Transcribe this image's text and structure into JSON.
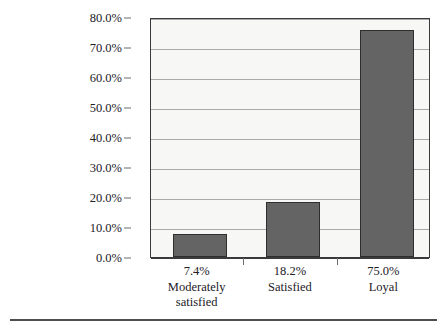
{
  "chart_data": {
    "type": "bar",
    "title": "",
    "subtitle": "",
    "xlabel": "",
    "ylabel": "",
    "categories": [
      "Moderately satisfied",
      "Satisfied",
      "Loyal"
    ],
    "category_lines": [
      [
        "7.4%",
        "Moderately",
        "satisfied"
      ],
      [
        "18.2%",
        "Satisfied"
      ],
      [
        "75.0%",
        "Loyal"
      ]
    ],
    "value_labels": [
      "7.4%",
      "18.2%",
      "75.0%"
    ],
    "values": [
      7.4,
      18.2,
      75.0
    ],
    "bar_plotted_values": [
      7.8,
      18.5,
      75.8
    ],
    "ylim": [
      0,
      80
    ],
    "ytick_step": 10,
    "ytick_labels": [
      "80.0%",
      "70.0%",
      "60.0%",
      "50.0%",
      "40.0%",
      "30.0%",
      "20.0%",
      "10.0%",
      "0.0%"
    ],
    "ytick_values": [
      80,
      70,
      60,
      50,
      40,
      30,
      20,
      10,
      0
    ],
    "grid": true,
    "legend": false,
    "legend_position": "none",
    "colors": {
      "bar_fill": "#646464",
      "bar_border": "#2e2e2e",
      "plot_background": "#f7f7f5",
      "plot_frame": "#3a3a3a",
      "gridline": "#a9a9a9",
      "text": "#22201f",
      "page_rule": "#4e4e4e"
    }
  }
}
